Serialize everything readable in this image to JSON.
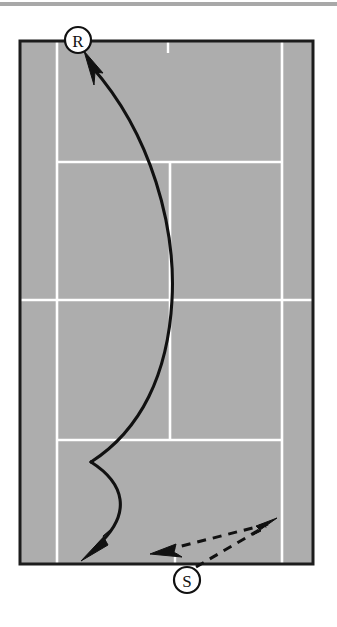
{
  "figure": {
    "kind": "tennis-court-play-diagram",
    "surface_color": "#adadad",
    "line_color": "#ffffff",
    "ink_color": "#111111",
    "page_background": "#ffffff",
    "top_rule_color": "#a8a8a8"
  },
  "court": {
    "outer": {
      "x": 20,
      "y": 41,
      "width": 293,
      "height": 523
    },
    "singles_sideline_left_x": 57,
    "singles_sideline_right_x": 282,
    "service_line_top_y": 162,
    "service_line_bottom_y": 440,
    "net_line_y": 300,
    "center_service_line_x": 170,
    "center_mark_top": {
      "x": 168,
      "y1": 41,
      "y2": 53
    },
    "center_mark_bottom": {
      "x": 175,
      "y1": 553,
      "y2": 564
    }
  },
  "markers": [
    {
      "id": "receiver",
      "label": "R",
      "cx": 78,
      "cy": 40,
      "r": 13,
      "role": "receiver-position"
    },
    {
      "id": "server",
      "label": "S",
      "cx": 187,
      "cy": 580,
      "r": 13,
      "role": "server-position"
    }
  ],
  "paths": [
    {
      "id": "return-shot",
      "style": "solid",
      "description": "ball flight curving from near the server baseline up the court to the receiver corner",
      "arrowheads": 2,
      "d": "M 86 53 C 150 130 176 225 172 300 C 168 375 140 430 90 463",
      "arrow_tip": {
        "x": 86,
        "y": 53
      },
      "arrow_angle_deg": -129
    },
    {
      "id": "recovery-shot",
      "style": "solid",
      "description": "second solid stroke from the cusp curving right then down to the baseline corner",
      "arrowheads": 1,
      "d": "M 90 463 C 122 482 132 512 96 547",
      "arrow_tip": {
        "x": 89,
        "y": 556
      },
      "arrow_angle_deg": 130
    },
    {
      "id": "server-movement-out",
      "style": "dashed",
      "description": "server moves from behind baseline diagonally up-right into the court",
      "d": "M 197 568 L 272 524",
      "arrow_tip": {
        "x": 275,
        "y": 521
      },
      "arrow_angle_deg": -30
    },
    {
      "id": "server-movement-back",
      "style": "dashed",
      "description": "server moves back diagonally down-left toward the baseline centre",
      "d": "M 268 523 L 162 551",
      "arrow_tip": {
        "x": 153,
        "y": 553
      },
      "arrow_angle_deg": 165
    }
  ],
  "legend": {
    "receiver_label": "R",
    "server_label": "S"
  }
}
